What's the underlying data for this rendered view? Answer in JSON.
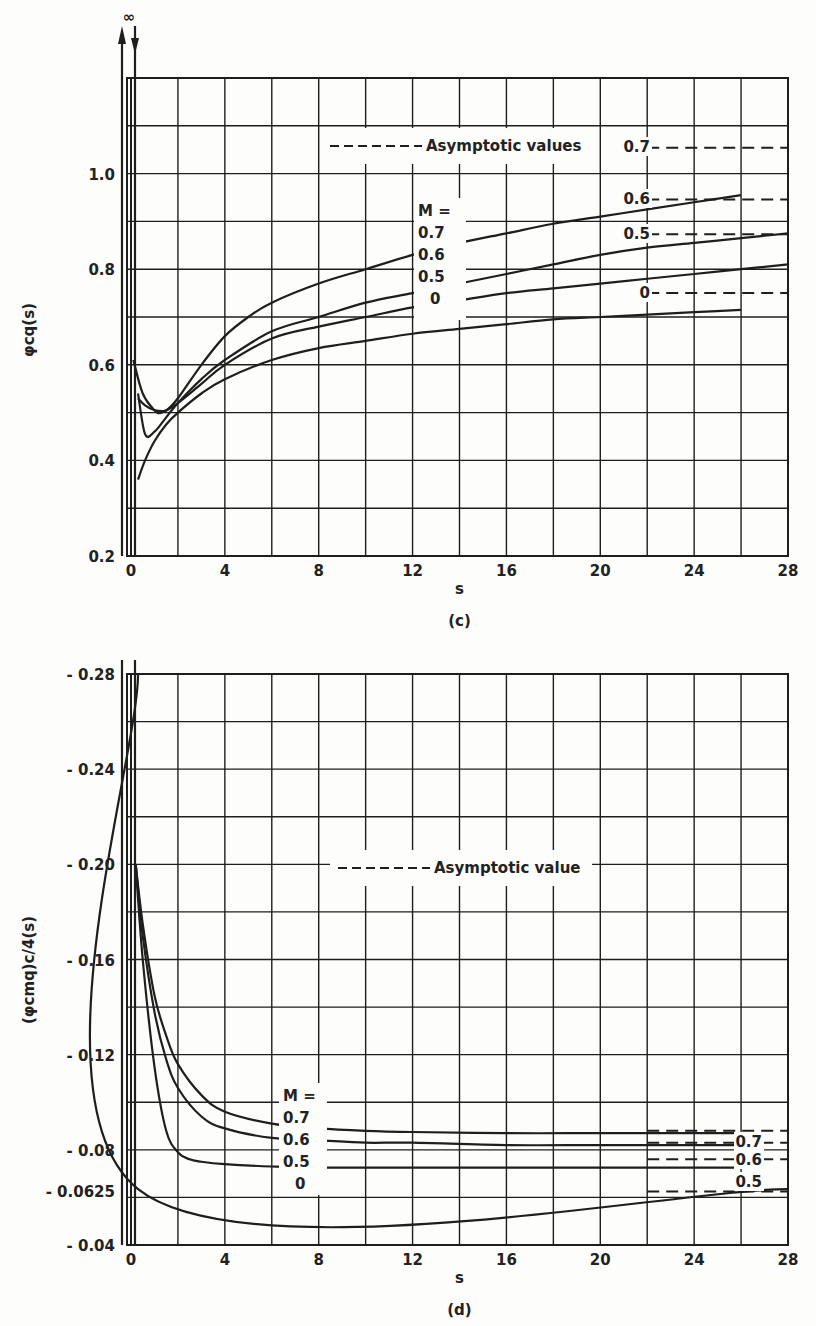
{
  "chart_data": [
    {
      "id": "c",
      "type": "line",
      "caption": "(c)",
      "title": "",
      "xlabel": "s",
      "ylabel": "φcq(s)",
      "xlim": [
        0,
        28
      ],
      "ylim": [
        0.2,
        1.2
      ],
      "x_ticks": [
        "0",
        "4",
        "8",
        "12",
        "16",
        "20",
        "24",
        "28"
      ],
      "y_ticks": [
        "0.2",
        "0.4",
        "0.6",
        "0.8",
        "1.0"
      ],
      "grid": true,
      "infinity_marker": "∞",
      "legend": {
        "text": "Asymptotic values",
        "style": "dashed"
      },
      "series_header": "M =",
      "series": [
        {
          "name": "0.7",
          "x": [
            0.3,
            0.6,
            1.0,
            1.5,
            2,
            3,
            4,
            5,
            6,
            8,
            10,
            12,
            14,
            16,
            18,
            20,
            22,
            24,
            26
          ],
          "values": [
            0.53,
            0.515,
            0.505,
            0.505,
            0.53,
            0.6,
            0.66,
            0.7,
            0.73,
            0.77,
            0.8,
            0.83,
            0.855,
            0.875,
            0.895,
            0.91,
            0.925,
            0.94,
            0.955
          ],
          "asymptote": 1.054
        },
        {
          "name": "0.6",
          "x": [
            0.3,
            0.6,
            1.0,
            1.5,
            2,
            3,
            4,
            6,
            8,
            10,
            12,
            14,
            16,
            18,
            20,
            22,
            24,
            26,
            28
          ],
          "values": [
            0.54,
            0.455,
            0.46,
            0.49,
            0.52,
            0.57,
            0.61,
            0.67,
            0.7,
            0.73,
            0.75,
            0.77,
            0.79,
            0.81,
            0.83,
            0.845,
            0.855,
            0.865,
            0.875
          ],
          "asymptote": 0.946
        },
        {
          "name": "0.5",
          "x": [
            0.1,
            0.5,
            1.0,
            1.3,
            2,
            3,
            4,
            6,
            8,
            10,
            12,
            14,
            16,
            18,
            20,
            22,
            24,
            26,
            28
          ],
          "values": [
            0.61,
            0.54,
            0.505,
            0.5,
            0.52,
            0.56,
            0.6,
            0.655,
            0.68,
            0.7,
            0.72,
            0.735,
            0.75,
            0.76,
            0.77,
            0.78,
            0.79,
            0.8,
            0.81
          ],
          "asymptote": 0.873
        },
        {
          "name": "0",
          "x": [
            0.3,
            0.6,
            1.0,
            1.5,
            2,
            3,
            4,
            6,
            8,
            10,
            12,
            14,
            16,
            18,
            20,
            22,
            24,
            26
          ],
          "values": [
            0.36,
            0.4,
            0.44,
            0.475,
            0.5,
            0.54,
            0.57,
            0.61,
            0.635,
            0.65,
            0.665,
            0.675,
            0.685,
            0.695,
            0.7,
            0.705,
            0.71,
            0.715
          ],
          "asymptote": 0.75
        }
      ],
      "annotations": [
        {
          "text": "0.5",
          "note": "label pointing to M=0.5 curve minimum near s≈1"
        }
      ]
    },
    {
      "id": "d",
      "type": "line",
      "caption": "(d)",
      "title": "",
      "xlabel": "s",
      "ylabel": "(φcmq)c/4(s)",
      "xlim": [
        0,
        28
      ],
      "ylim": [
        -0.28,
        -0.04
      ],
      "x_ticks": [
        "0",
        "4",
        "8",
        "12",
        "16",
        "20",
        "24",
        "28"
      ],
      "y_ticks": [
        "-0.28",
        "-0.24",
        "-0.20",
        "-0.16",
        "-0.12",
        "-0.08",
        "-0.0625",
        "-0.04"
      ],
      "grid": true,
      "infinity_marker": "∞",
      "legend": {
        "text": "Asymptotic value",
        "style": "dashed"
      },
      "series_header": "M =",
      "series": [
        {
          "name": "0.7",
          "x": [
            0.2,
            0.5,
            1,
            1.5,
            2,
            3,
            4,
            6,
            8,
            10,
            12,
            16,
            20,
            24,
            26
          ],
          "values": [
            -0.2,
            -0.175,
            -0.145,
            -0.128,
            -0.116,
            -0.103,
            -0.096,
            -0.091,
            -0.089,
            -0.088,
            -0.0875,
            -0.087,
            -0.087,
            -0.087,
            -0.087
          ],
          "asymptote": -0.088
        },
        {
          "name": "0.6",
          "x": [
            0.2,
            0.5,
            1,
            1.5,
            2,
            3,
            4,
            6,
            8,
            10,
            12,
            16,
            20,
            24,
            26
          ],
          "values": [
            -0.2,
            -0.17,
            -0.138,
            -0.118,
            -0.106,
            -0.094,
            -0.089,
            -0.085,
            -0.084,
            -0.083,
            -0.083,
            -0.082,
            -0.082,
            -0.082,
            -0.082
          ],
          "asymptote": -0.083
        },
        {
          "name": "0.5",
          "x": [
            0.2,
            0.5,
            1,
            1.5,
            2,
            2.5,
            3,
            4,
            6,
            8,
            12,
            16,
            20,
            24,
            26
          ],
          "values": [
            -0.2,
            -0.16,
            -0.115,
            -0.088,
            -0.079,
            -0.076,
            -0.075,
            -0.074,
            -0.073,
            -0.0725,
            -0.0725,
            -0.0725,
            -0.0725,
            -0.0725,
            -0.0725
          ],
          "asymptote": -0.076
        },
        {
          "name": "0",
          "x": [
            0.3,
            0.3,
            28
          ],
          "values": [
            -0.28,
            -0.0635,
            -0.0635
          ],
          "asymptote": -0.0625
        }
      ]
    }
  ]
}
